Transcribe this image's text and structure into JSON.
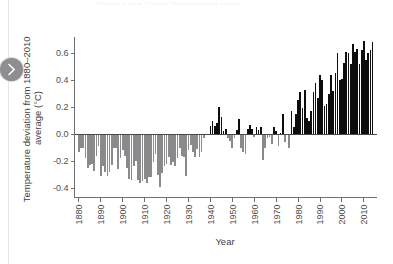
{
  "page": {
    "background_color": "#ffffff",
    "clipped_title": "Global Land-Ocean Temperature Index"
  },
  "nav": {
    "next_button_label": "Next",
    "next_icon": "chevron-right-icon",
    "button_color": "#8e8e92"
  },
  "chart_data": {
    "type": "bar",
    "title": "",
    "xlabel": "Year",
    "ylabel": "Temperature deviation from 1880–2010 average (°C)",
    "xlim": [
      1878,
      2016
    ],
    "ylim": [
      -0.47,
      0.72
    ],
    "yticks": [
      -0.4,
      -0.2,
      0.0,
      0.2,
      0.4,
      0.6
    ],
    "ytick_labels": [
      "-0.4",
      "-0.2",
      "0.0",
      "0.2",
      "0.4",
      "0.6"
    ],
    "xticks": [
      1880,
      1890,
      1900,
      1910,
      1920,
      1930,
      1940,
      1950,
      1960,
      1970,
      1980,
      1990,
      2000,
      2010
    ],
    "xtick_labels": [
      "1880",
      "1890",
      "1900",
      "1910",
      "1920",
      "1930",
      "1940",
      "1950",
      "1960",
      "1970",
      "1980",
      "1990",
      "2000",
      "2010"
    ],
    "grid": false,
    "legend": null,
    "positive_bar_color": "#0d0d0d",
    "negative_bar_color": "#8a8a8c",
    "zero_line_color": "#4a4a4d",
    "axis_color": "#6f6f72",
    "categories": [
      1880,
      1881,
      1882,
      1883,
      1884,
      1885,
      1886,
      1887,
      1888,
      1889,
      1890,
      1891,
      1892,
      1893,
      1894,
      1895,
      1896,
      1897,
      1898,
      1899,
      1900,
      1901,
      1902,
      1903,
      1904,
      1905,
      1906,
      1907,
      1908,
      1909,
      1910,
      1911,
      1912,
      1913,
      1914,
      1915,
      1916,
      1917,
      1918,
      1919,
      1920,
      1921,
      1922,
      1923,
      1924,
      1925,
      1926,
      1927,
      1928,
      1929,
      1930,
      1931,
      1932,
      1933,
      1934,
      1935,
      1936,
      1937,
      1938,
      1939,
      1940,
      1941,
      1942,
      1943,
      1944,
      1945,
      1946,
      1947,
      1948,
      1949,
      1950,
      1951,
      1952,
      1953,
      1954,
      1955,
      1956,
      1957,
      1958,
      1959,
      1960,
      1961,
      1962,
      1963,
      1964,
      1965,
      1966,
      1967,
      1968,
      1969,
      1970,
      1971,
      1972,
      1973,
      1974,
      1975,
      1976,
      1977,
      1978,
      1979,
      1980,
      1981,
      1982,
      1983,
      1984,
      1985,
      1986,
      1987,
      1988,
      1989,
      1990,
      1991,
      1992,
      1993,
      1994,
      1995,
      1996,
      1997,
      1998,
      1999,
      2000,
      2001,
      2002,
      2003,
      2004,
      2005,
      2006,
      2007,
      2008,
      2009,
      2010,
      2011,
      2012,
      2013,
      2014
    ],
    "values": [
      -0.13,
      -0.1,
      -0.1,
      -0.18,
      -0.25,
      -0.23,
      -0.22,
      -0.27,
      -0.16,
      -0.09,
      -0.31,
      -0.24,
      -0.28,
      -0.31,
      -0.28,
      -0.23,
      -0.1,
      -0.1,
      -0.26,
      -0.18,
      -0.12,
      -0.16,
      -0.25,
      -0.33,
      -0.34,
      -0.24,
      -0.2,
      -0.34,
      -0.36,
      -0.35,
      -0.33,
      -0.36,
      -0.32,
      -0.32,
      -0.21,
      -0.15,
      -0.3,
      -0.39,
      -0.29,
      -0.24,
      -0.22,
      -0.17,
      -0.23,
      -0.21,
      -0.24,
      -0.18,
      -0.1,
      -0.16,
      -0.17,
      -0.31,
      -0.12,
      -0.08,
      -0.13,
      -0.17,
      -0.11,
      -0.17,
      -0.13,
      -0.03,
      -0.01,
      0.0,
      0.06,
      0.1,
      0.06,
      0.08,
      0.2,
      0.13,
      0.02,
      0.04,
      -0.03,
      -0.05,
      -0.1,
      -0.03,
      0.03,
      0.11,
      -0.1,
      -0.13,
      -0.15,
      0.04,
      0.07,
      0.04,
      -0.02,
      0.05,
      0.03,
      0.05,
      -0.19,
      -0.1,
      -0.03,
      -0.02,
      -0.07,
      0.05,
      0.02,
      -0.09,
      0.01,
      0.15,
      -0.06,
      -0.01,
      -0.1,
      0.17,
      0.05,
      0.15,
      0.25,
      0.31,
      0.19,
      0.33,
      0.12,
      0.1,
      0.17,
      0.31,
      0.38,
      0.27,
      0.44,
      0.4,
      0.21,
      0.22,
      0.3,
      0.44,
      0.32,
      0.45,
      0.6,
      0.4,
      0.41,
      0.53,
      0.61,
      0.6,
      0.52,
      0.67,
      0.61,
      0.63,
      0.52,
      0.62,
      0.69,
      0.55,
      0.6,
      0.62,
      0.68
    ]
  }
}
